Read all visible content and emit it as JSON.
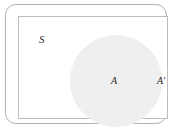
{
  "diagram": {
    "type": "venn-set-diagram",
    "labels": {
      "universal_set": "S",
      "set": "A",
      "complement": "A′"
    },
    "colors": {
      "background": "#ffffff",
      "circle_fill": "#efefef",
      "outer_border": "#b3b3b3",
      "inner_border": "#bdbdbd",
      "label_text": "#2b2b2b"
    }
  }
}
